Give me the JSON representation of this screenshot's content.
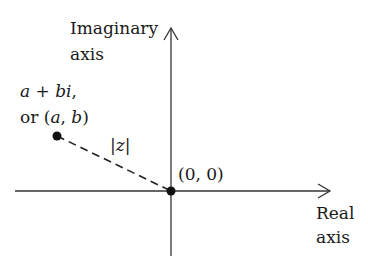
{
  "diagram": {
    "type": "complex-plane",
    "axes": {
      "imaginary": {
        "label_line1": "Imaginary",
        "label_line2": "axis"
      },
      "real": {
        "label_line1": "Real",
        "label_line2": "axis"
      }
    },
    "point": {
      "label_line1_a": "a",
      "label_line1_op": " + ",
      "label_line1_b": "bi",
      "label_line1_end": ",",
      "label_line2_pre": "or (",
      "label_line2_a": "a",
      "label_line2_sep": ", ",
      "label_line2_b": "b",
      "label_line2_end": ")"
    },
    "origin": {
      "label": "(0, 0)"
    },
    "modulus": {
      "bar_left": "|",
      "var": "z",
      "bar_right": "|"
    },
    "colors": {
      "ink": "#1a1a1a",
      "axis": "#333333",
      "background": "#ffffff"
    }
  }
}
